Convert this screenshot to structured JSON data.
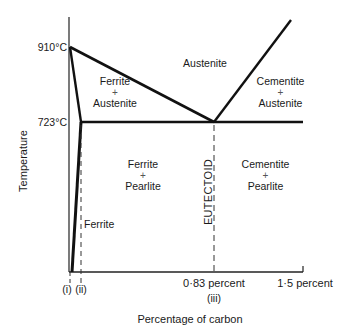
{
  "diagram": {
    "type": "iron-carbon phase diagram",
    "y_axis": {
      "label": "Temperature",
      "ticks": [
        {
          "label": "910°C"
        },
        {
          "label": "723°C"
        }
      ]
    },
    "x_axis": {
      "label": "Percentage of carbon",
      "ticks": [
        {
          "label": "(i)"
        },
        {
          "label": "(ii)"
        },
        {
          "label": "0·83 percent",
          "sub": "(iii)"
        },
        {
          "label": "1·5 percent"
        }
      ]
    },
    "regions": {
      "austenite": "Austenite",
      "ferrite_austenite": {
        "line1": "Ferrite",
        "plus": "+",
        "line2": "Austenite"
      },
      "cementite_austenite": {
        "line1": "Cementite",
        "plus": "+",
        "line2": "Austenite"
      },
      "ferrite_pearlite": {
        "line1": "Ferrite",
        "plus": "+",
        "line2": "Pearlite"
      },
      "cementite_pearlite": {
        "line1": "Cementite",
        "plus": "+",
        "line2": "Pearlite"
      },
      "ferrite": "Ferrite"
    },
    "eutectoid_label": "EUTECTOID"
  }
}
